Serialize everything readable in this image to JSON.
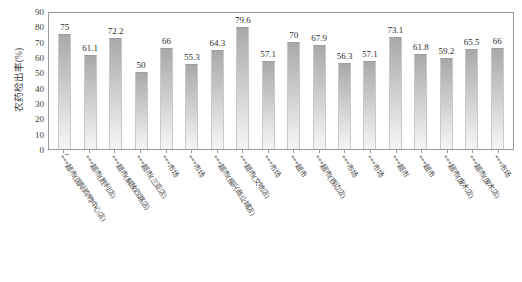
{
  "chart_data": {
    "type": "bar",
    "title": "",
    "xlabel": "",
    "ylabel": "农药检出率(%)",
    "ylim": [
      0,
      90
    ],
    "yticks": [
      90,
      80,
      70,
      60,
      50,
      40,
      30,
      20,
      10,
      0
    ],
    "grid": false,
    "legend": false,
    "categories": [
      "***超市(国际购物中心店)",
      "***超市(胜利店)",
      "***超市(解放四路店)",
      "***超市(三亚店)",
      "***市场",
      "***市场",
      "***超市(振兴商业城店)",
      "***超市(文地店)",
      "***市场",
      "***超市",
      "***超市(铁边店)",
      "***市场",
      "***市场",
      "***超市",
      "***超市",
      "***超市(废木店)",
      "***超市(废木店)",
      "***市场"
    ],
    "values": [
      75,
      61.1,
      72.2,
      50,
      66,
      55.3,
      64.3,
      79.6,
      57.1,
      70,
      67.9,
      56.3,
      57.1,
      73.1,
      61.8,
      59.2,
      65.5,
      66
    ],
    "value_labels": [
      "75",
      "61.1",
      "72.2",
      "50",
      "66",
      "55.3",
      "64.3",
      "79.6",
      "57.1",
      "70",
      "67.9",
      "56.3",
      "57.1",
      "73.1",
      "61.8",
      "59.2",
      "65.5",
      "66"
    ],
    "bar_color": "#c3c3c3",
    "axis_color": "#9a9a9a"
  },
  "caption": ""
}
